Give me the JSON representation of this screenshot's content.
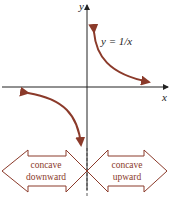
{
  "figure": {
    "equation": "y = 1/x",
    "x_axis_label": "x",
    "y_axis_label": "y",
    "left_region": {
      "line1": "concave",
      "line2": "downward"
    },
    "right_region": {
      "line1": "concave",
      "line2": "upward"
    },
    "colors": {
      "curve": "#8b3a2a",
      "axes": "#222222",
      "arrow_outline": "#8b3a2a"
    }
  }
}
